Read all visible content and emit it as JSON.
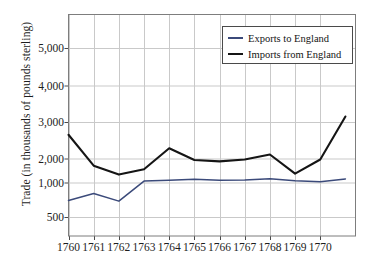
{
  "chart_data": {
    "type": "line",
    "title": "",
    "xlabel": "",
    "ylabel": "Trade (in thousands of pounds sterling)",
    "x": [
      1760,
      1761,
      1762,
      1763,
      1764,
      1765,
      1766,
      1767,
      1768,
      1769,
      1770,
      1771
    ],
    "xtick_labels": [
      "1760",
      "1761",
      "1762",
      "1763",
      "1764",
      "1765",
      "1766",
      "1767",
      "1768",
      "1769",
      "1770"
    ],
    "ytick_labels": [
      "5,000",
      "4,000",
      "3,000",
      "2,000",
      "1,000",
      "500"
    ],
    "ytick_values": [
      5000,
      4000,
      3000,
      2000,
      1000,
      500
    ],
    "ylim": [
      0,
      5800
    ],
    "xlim": [
      1760,
      1771.4
    ],
    "grid": true,
    "legend_position": "top-right",
    "series": [
      {
        "name": "Exports to England",
        "color": "#3b4a7a",
        "values": [
          740,
          840,
          730,
          1060,
          1090,
          1140,
          1090,
          1100,
          1160,
          1070,
          1030,
          1150
        ]
      },
      {
        "name": "Imports from England",
        "color": "#151515",
        "values": [
          2650,
          1700,
          1330,
          1550,
          2280,
          1940,
          1880,
          1960,
          2110,
          1370,
          1960,
          3150
        ]
      }
    ]
  },
  "chart": {
    "ylabel": "Trade (in thousands of pounds sterling)",
    "legend": [
      {
        "label": "Exports to England",
        "color": "#3b4a7a"
      },
      {
        "label": "Imports from England",
        "color": "#151515"
      }
    ]
  },
  "style": {
    "grid_color": "#c9c9c9",
    "frame_color": "#7d7d7d",
    "background": "#ffffff",
    "text_color": "#1d1d1d"
  }
}
